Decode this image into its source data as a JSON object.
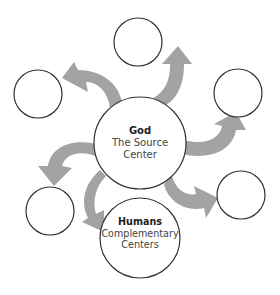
{
  "diagram": {
    "colors": {
      "arrow": "#a3a3a3",
      "outline": "#333333",
      "background": "#ffffff"
    },
    "center_node": {
      "title": "God",
      "line1": "The Source",
      "line2": "Center"
    },
    "secondary_node": {
      "title": "Humans",
      "line1": "Complementary",
      "line2": "Centers"
    },
    "empty_nodes": [
      {
        "position": "top",
        "cx": 138,
        "cy": 42
      },
      {
        "position": "upper-left",
        "cx": 38,
        "cy": 94
      },
      {
        "position": "upper-right",
        "cx": 238,
        "cy": 93
      },
      {
        "position": "lower-left",
        "cx": 50,
        "cy": 211
      },
      {
        "position": "lower-right",
        "cx": 241,
        "cy": 195
      }
    ],
    "arrows": [
      {
        "from": "God",
        "to": "top"
      },
      {
        "from": "God",
        "to": "upper-left"
      },
      {
        "from": "God",
        "to": "upper-right"
      },
      {
        "from": "God",
        "to": "lower-left"
      },
      {
        "from": "God",
        "to": "Humans"
      },
      {
        "from": "God",
        "to": "lower-right"
      }
    ]
  }
}
